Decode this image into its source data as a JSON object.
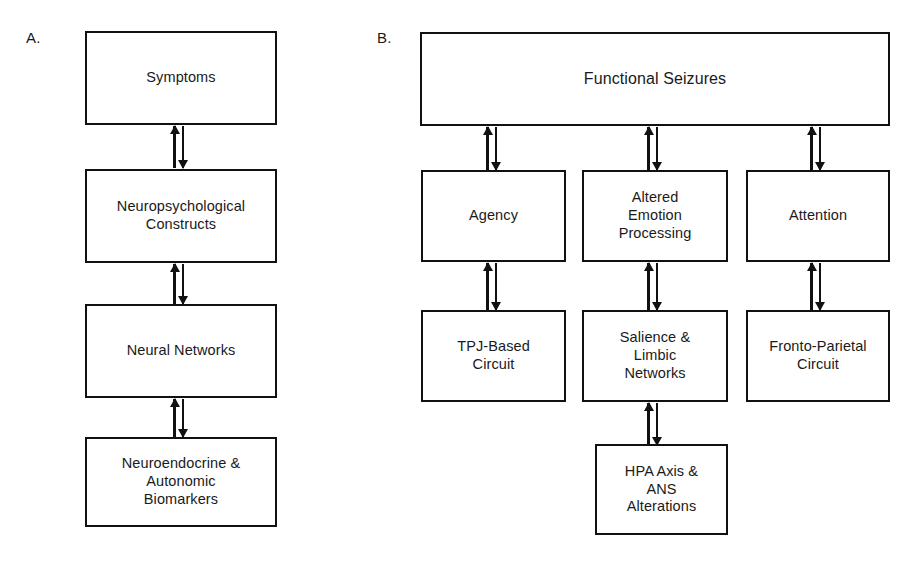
{
  "figure": {
    "panels": [
      {
        "id": "A",
        "label": "A.",
        "nodes": [
          {
            "id": "a1",
            "text": "Symptoms"
          },
          {
            "id": "a2",
            "text": "Neuropsychological\nConstructs"
          },
          {
            "id": "a3",
            "text": "Neural Networks"
          },
          {
            "id": "a4",
            "text": "Neuroendocrine &\nAutonomic\nBiomarkers"
          }
        ],
        "connectors": [
          {
            "id": "a-c1",
            "from": "a1",
            "to": "a2",
            "kind": "bidirectional"
          },
          {
            "id": "a-c2",
            "from": "a2",
            "to": "a3",
            "kind": "bidirectional"
          },
          {
            "id": "a-c3",
            "from": "a3",
            "to": "a4",
            "kind": "bidirectional"
          }
        ]
      },
      {
        "id": "B",
        "label": "B.",
        "nodes": [
          {
            "id": "b1",
            "text": "Functional Seizures"
          },
          {
            "id": "b2",
            "text": "Agency"
          },
          {
            "id": "b3",
            "text": "Altered\nEmotion\nProcessing"
          },
          {
            "id": "b4",
            "text": "Attention"
          },
          {
            "id": "b5",
            "text": "TPJ-Based\nCircuit"
          },
          {
            "id": "b6",
            "text": "Salience &\nLimbic\nNetworks"
          },
          {
            "id": "b7",
            "text": "Fronto-Parietal\nCircuit"
          },
          {
            "id": "b8",
            "text": "HPA Axis &\nANS\nAlterations"
          }
        ],
        "connectors": [
          {
            "id": "b-c1",
            "from": "b1",
            "to": "b2",
            "kind": "bidirectional"
          },
          {
            "id": "b-c2",
            "from": "b1",
            "to": "b3",
            "kind": "bidirectional"
          },
          {
            "id": "b-c3",
            "from": "b1",
            "to": "b4",
            "kind": "bidirectional"
          },
          {
            "id": "b-c4",
            "from": "b2",
            "to": "b5",
            "kind": "bidirectional"
          },
          {
            "id": "b-c5",
            "from": "b3",
            "to": "b6",
            "kind": "bidirectional"
          },
          {
            "id": "b-c6",
            "from": "b4",
            "to": "b7",
            "kind": "bidirectional"
          },
          {
            "id": "b-c7",
            "from": "b6",
            "to": "b8",
            "kind": "bidirectional"
          }
        ]
      }
    ],
    "colors": {
      "background": "#ffffff",
      "stroke": "#111111",
      "text": "#1a1a1a"
    }
  }
}
